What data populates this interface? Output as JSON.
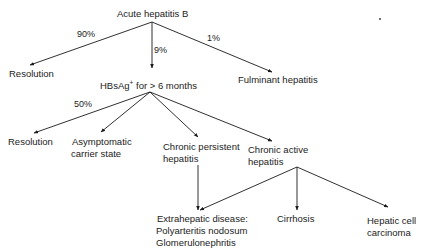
{
  "diagram": {
    "title_node": "Acute hepatitis B",
    "level1": {
      "branches": [
        {
          "percent": "90%",
          "target": "Resolution"
        },
        {
          "percent": "9%",
          "target": "HBsAg+ for > 6 months"
        },
        {
          "percent": "1%",
          "target": "Fulminant hepatitis"
        }
      ]
    },
    "hbsag_node": {
      "prefix": "HBsAg",
      "superscript": "+",
      "suffix": " for > 6 months"
    },
    "level2": {
      "branches": [
        {
          "percent": "50%",
          "target": "Resolution"
        },
        {
          "percent": "",
          "target": "Asymptomatic carrier state"
        },
        {
          "percent": "",
          "target": "Chronic persistent hepatitis"
        },
        {
          "percent": "",
          "target": "Chronic active hepatitis"
        }
      ]
    },
    "nodes": {
      "resolution_1": "Resolution",
      "fulminant": "Fulminant hepatitis",
      "resolution_2": "Resolution",
      "asymptomatic_line1": "Asymptomatic",
      "asymptomatic_line2": "carrier state",
      "cph_line1": "Chronic persistent",
      "cph_line2": "hepatitis",
      "cah_line1": "Chronic active",
      "cah_line2": "hepatitis",
      "extra_line1": "Extrahepatic disease:",
      "extra_line2": "Polyarteritis nodosum",
      "extra_line3": "Glomerulonephritis",
      "cirrhosis": "Cirrhosis",
      "hcc_line1": "Hepatic cell",
      "hcc_line2": "carcinoma"
    },
    "percents": {
      "p90": "90%",
      "p9": "9%",
      "p1": "1%",
      "p50": "50%"
    },
    "line_color": "#1a1a1a"
  }
}
